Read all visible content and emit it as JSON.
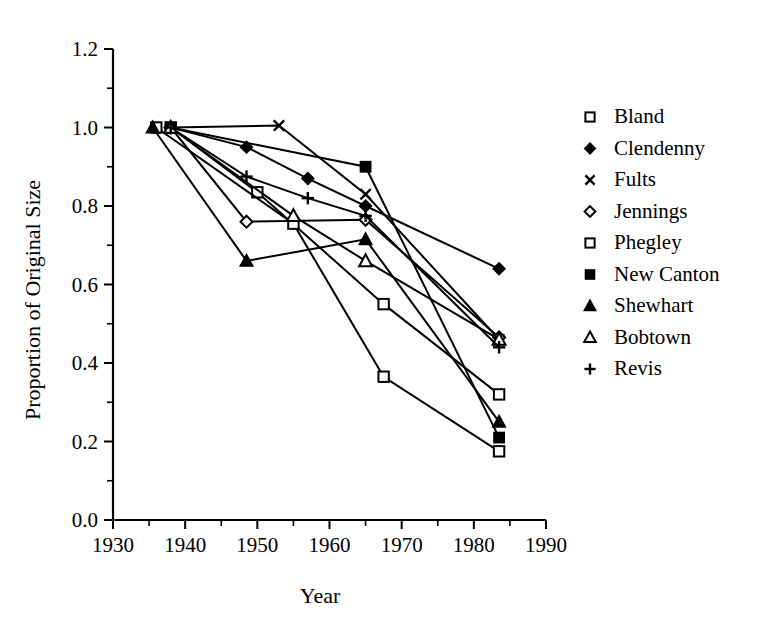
{
  "chart_data": {
    "type": "line",
    "title": "",
    "xlabel": "Year",
    "ylabel": "Proportion of Original Size",
    "xlim": [
      1930,
      1990
    ],
    "ylim": [
      0.0,
      1.2
    ],
    "xticks": [
      1930,
      1940,
      1950,
      1960,
      1970,
      1980,
      1990
    ],
    "xtick_labels": [
      "1930",
      "1940",
      "1950",
      "1960",
      "1970",
      "1980",
      "1990"
    ],
    "xminor_step": 5,
    "yticks": [
      0.0,
      0.2,
      0.4,
      0.6,
      0.8,
      1.0,
      1.2
    ],
    "ytick_labels": [
      "0.0",
      "0.2",
      "0.4",
      "0.6",
      "0.8",
      "1.0",
      "1.2"
    ],
    "yminor_step": 0.1,
    "grid": false,
    "legend_position": "right",
    "line_color": "#000000",
    "series": [
      {
        "name": "Bland",
        "marker": "open-square",
        "x": [
          1938,
          1950,
          1967.5,
          1983.5
        ],
        "y": [
          1.0,
          0.835,
          0.55,
          0.32
        ]
      },
      {
        "name": "Clendenny",
        "marker": "filled-diamond",
        "x": [
          1938,
          1948.5,
          1957,
          1965,
          1983.5
        ],
        "y": [
          1.0,
          0.95,
          0.87,
          0.8,
          0.64
        ]
      },
      {
        "name": "Fults",
        "marker": "cross-x",
        "x": [
          1938,
          1953,
          1965,
          1983.5
        ],
        "y": [
          1.0,
          1.005,
          0.83,
          0.46
        ]
      },
      {
        "name": "Jennings",
        "marker": "open-diamond",
        "x": [
          1938,
          1948.5,
          1965,
          1983.5
        ],
        "y": [
          1.0,
          0.76,
          0.765,
          0.465
        ]
      },
      {
        "name": "Phegley",
        "marker": "open-square",
        "x": [
          1936,
          1955,
          1967.5,
          1983.5
        ],
        "y": [
          1.0,
          0.755,
          0.365,
          0.175
        ]
      },
      {
        "name": "New Canton",
        "marker": "filled-square",
        "x": [
          1938,
          1965,
          1983.5
        ],
        "y": [
          1.0,
          0.9,
          0.21
        ]
      },
      {
        "name": "Shewhart",
        "marker": "filled-triangle",
        "x": [
          1935.5,
          1948.5,
          1965,
          1983.5
        ],
        "y": [
          1.0,
          0.66,
          0.715,
          0.25
        ]
      },
      {
        "name": "Bobtown",
        "marker": "open-triangle",
        "x": [
          1938,
          1955,
          1965,
          1983.5
        ],
        "y": [
          1.0,
          0.775,
          0.66,
          0.46
        ]
      },
      {
        "name": "Revis",
        "marker": "plus",
        "x": [
          1938,
          1948.5,
          1957,
          1965,
          1983.5
        ],
        "y": [
          1.0,
          0.875,
          0.82,
          0.775,
          0.44
        ]
      }
    ]
  },
  "legend": {
    "entries": [
      {
        "label": "Bland",
        "marker": "open-square"
      },
      {
        "label": "Clendenny",
        "marker": "filled-diamond"
      },
      {
        "label": "Fults",
        "marker": "cross-x"
      },
      {
        "label": "Jennings",
        "marker": "open-diamond"
      },
      {
        "label": "Phegley",
        "marker": "open-square"
      },
      {
        "label": "New Canton",
        "marker": "filled-square"
      },
      {
        "label": "Shewhart",
        "marker": "filled-triangle"
      },
      {
        "label": "Bobtown",
        "marker": "open-triangle"
      },
      {
        "label": "Revis",
        "marker": "plus"
      }
    ]
  }
}
